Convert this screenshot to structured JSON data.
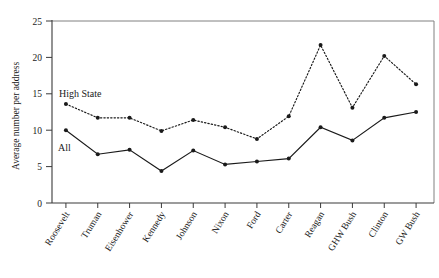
{
  "chart_data": {
    "type": "line",
    "title": "",
    "xlabel": "",
    "ylabel": "Average number per address",
    "ylim": [
      0,
      25
    ],
    "yticks": [
      0,
      5,
      10,
      15,
      20,
      25
    ],
    "ytick_labels": [
      "0",
      "5",
      "10",
      "15",
      "20",
      "25"
    ],
    "grid": false,
    "legend_position": "inline-annotation",
    "categories": [
      "Roosevelt",
      "Truman",
      "Eisenhower",
      "Kennedy",
      "Johnson",
      "Nixon",
      "Ford",
      "Carter",
      "Reagan",
      "GHW Bush",
      "Clinton",
      "GW Bush"
    ],
    "series": [
      {
        "name": "High State",
        "style": "dotted",
        "marker": "filled-circle",
        "values": [
          13.6,
          11.7,
          11.7,
          9.9,
          11.4,
          10.4,
          8.8,
          11.9,
          21.7,
          13.1,
          20.2,
          16.3
        ]
      },
      {
        "name": "All",
        "style": "solid",
        "marker": "filled-circle",
        "values": [
          10.0,
          6.7,
          7.3,
          4.4,
          7.2,
          5.3,
          5.7,
          6.1,
          10.4,
          8.6,
          11.7,
          12.5
        ]
      }
    ],
    "annotations": [
      {
        "text": "High State",
        "x_px": 59,
        "y_px": 97
      },
      {
        "text": "All",
        "x_px": 58,
        "y_px": 151
      }
    ]
  }
}
